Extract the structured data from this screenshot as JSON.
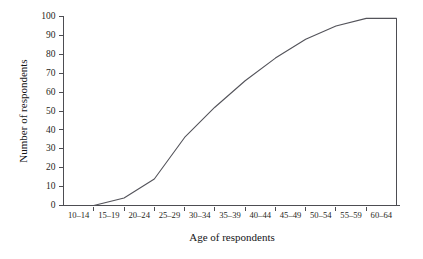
{
  "chart_data": {
    "type": "line",
    "title": "",
    "subtitle": "",
    "xlabel": "Age of respondents",
    "ylabel": "Number of respondents",
    "categories": [
      "10–14",
      "15–19",
      "20–24",
      "25–29",
      "30–34",
      "35–39",
      "40–44",
      "45–49",
      "50–54",
      "55–59",
      "60–64"
    ],
    "x": [
      "10–14",
      "15–19",
      "20–24",
      "25–29",
      "30–34",
      "35–39",
      "40–44",
      "45–49",
      "50–54",
      "55–59",
      "60–64"
    ],
    "values": [
      0,
      4,
      14,
      36,
      52,
      66,
      78,
      88,
      95,
      99,
      99
    ],
    "series": [
      {
        "name": "Cumulative number of respondents",
        "values": [
          0,
          4,
          14,
          36,
          52,
          66,
          78,
          88,
          95,
          99,
          99
        ]
      }
    ],
    "ylim": [
      0,
      100
    ],
    "yticks": [
      0,
      10,
      20,
      30,
      40,
      50,
      60,
      70,
      80,
      90,
      100
    ],
    "ytick_labels": [
      "0",
      "10",
      "20",
      "30",
      "40",
      "50",
      "60",
      "70",
      "80",
      "90",
      "100"
    ],
    "grid": false,
    "legend": false,
    "legend_position": "none",
    "line_color": "#53535a",
    "axis_color": "#4d4d52",
    "background_color": "#ffffff",
    "annotations": []
  },
  "axes": {
    "y_title": "Number of respondents",
    "x_title": "Age of respondents"
  }
}
